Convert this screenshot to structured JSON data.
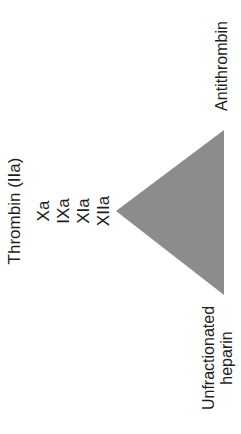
{
  "diagram": {
    "top_label": "Antithrombin",
    "bottom_label_line1": "Unfractionated",
    "bottom_label_line2": "heparin",
    "enzymes": {
      "thrombin": "Thrombin (IIa)",
      "xa": "Xa",
      "ixa": "IXa",
      "xia": "XIa",
      "xiia": "XIIa"
    },
    "colors": {
      "triangle": "#8c8c8c",
      "text": "#1e1e1e"
    }
  }
}
